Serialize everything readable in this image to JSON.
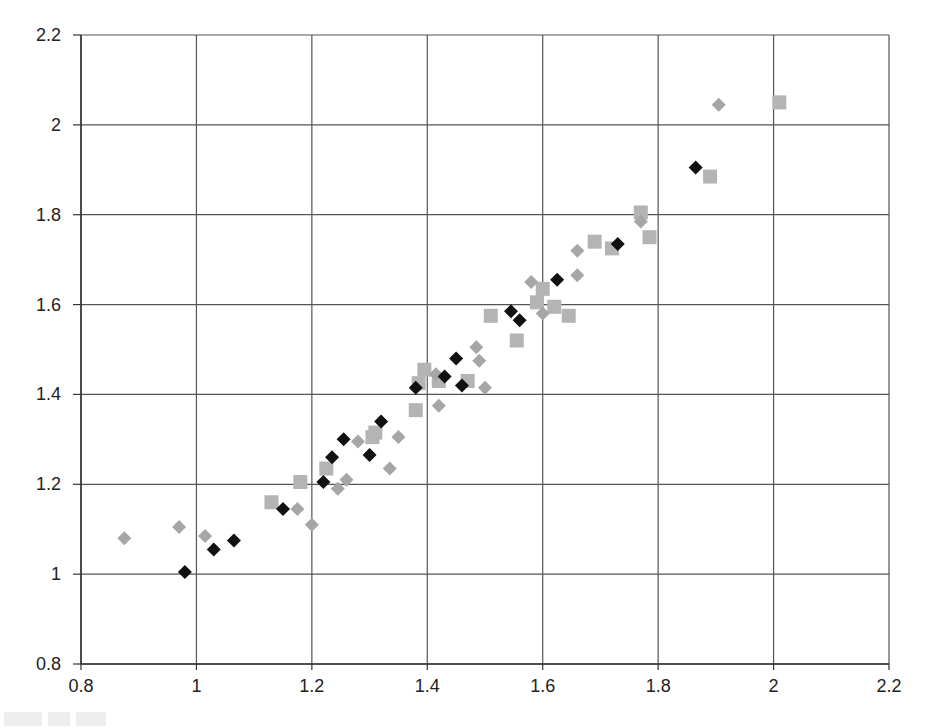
{
  "chart_data": {
    "type": "scatter",
    "title": "",
    "xlabel": "",
    "ylabel": "",
    "xlim": [
      0.8,
      2.2
    ],
    "ylim": [
      0.8,
      2.2
    ],
    "x_ticks": [
      0.8,
      1,
      1.2,
      1.4,
      1.6,
      1.8,
      2,
      2.2
    ],
    "y_ticks": [
      0.8,
      1,
      1.2,
      1.4,
      1.6,
      1.8,
      2,
      2.2
    ],
    "x_tick_labels": [
      "0.8",
      "1",
      "1.2",
      "1.4",
      "1.6",
      "1.8",
      "2",
      "2.2"
    ],
    "y_tick_labels": [
      "0.8",
      "1",
      "1.2",
      "1.4",
      "1.6",
      "1.8",
      "2",
      "2.2"
    ],
    "grid": true,
    "legend": null,
    "series": [
      {
        "name": "series-1",
        "marker": "diamond",
        "color": "#111111",
        "points": [
          [
            0.98,
            1.005
          ],
          [
            1.03,
            1.055
          ],
          [
            1.065,
            1.075
          ],
          [
            1.15,
            1.145
          ],
          [
            1.22,
            1.205
          ],
          [
            1.235,
            1.26
          ],
          [
            1.255,
            1.3
          ],
          [
            1.3,
            1.265
          ],
          [
            1.32,
            1.34
          ],
          [
            1.38,
            1.415
          ],
          [
            1.43,
            1.44
          ],
          [
            1.45,
            1.48
          ],
          [
            1.46,
            1.42
          ],
          [
            1.545,
            1.585
          ],
          [
            1.56,
            1.565
          ],
          [
            1.625,
            1.655
          ],
          [
            1.73,
            1.735
          ],
          [
            1.865,
            1.905
          ]
        ]
      },
      {
        "name": "series-2",
        "marker": "diamond",
        "color": "#a6a6a6",
        "points": [
          [
            0.875,
            1.08
          ],
          [
            0.97,
            1.105
          ],
          [
            1.015,
            1.085
          ],
          [
            1.175,
            1.145
          ],
          [
            1.2,
            1.11
          ],
          [
            1.245,
            1.19
          ],
          [
            1.26,
            1.21
          ],
          [
            1.28,
            1.295
          ],
          [
            1.335,
            1.235
          ],
          [
            1.35,
            1.305
          ],
          [
            1.42,
            1.375
          ],
          [
            1.415,
            1.445
          ],
          [
            1.49,
            1.475
          ],
          [
            1.485,
            1.505
          ],
          [
            1.5,
            1.415
          ],
          [
            1.58,
            1.65
          ],
          [
            1.6,
            1.58
          ],
          [
            1.66,
            1.665
          ],
          [
            1.66,
            1.72
          ],
          [
            1.77,
            1.785
          ],
          [
            1.905,
            2.045
          ]
        ]
      },
      {
        "name": "series-3",
        "marker": "square",
        "color": "#b4b4b4",
        "points": [
          [
            1.13,
            1.16
          ],
          [
            1.18,
            1.205
          ],
          [
            1.225,
            1.235
          ],
          [
            1.305,
            1.305
          ],
          [
            1.31,
            1.315
          ],
          [
            1.38,
            1.365
          ],
          [
            1.385,
            1.425
          ],
          [
            1.395,
            1.455
          ],
          [
            1.42,
            1.43
          ],
          [
            1.47,
            1.43
          ],
          [
            1.51,
            1.575
          ],
          [
            1.555,
            1.52
          ],
          [
            1.59,
            1.605
          ],
          [
            1.6,
            1.635
          ],
          [
            1.62,
            1.595
          ],
          [
            1.645,
            1.575
          ],
          [
            1.69,
            1.74
          ],
          [
            1.72,
            1.725
          ],
          [
            1.77,
            1.805
          ],
          [
            1.785,
            1.75
          ],
          [
            1.89,
            1.885
          ],
          [
            2.01,
            2.05
          ]
        ]
      }
    ]
  },
  "layout": {
    "plot_left": 81,
    "plot_right": 889,
    "plot_top": 35,
    "plot_bottom": 664,
    "axis_color": "#333333",
    "grid_color": "#555555"
  }
}
